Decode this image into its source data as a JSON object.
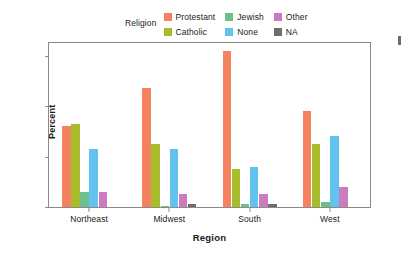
{
  "legend": {
    "title": "Religion",
    "position": "top-center",
    "items": [
      {
        "label": "Protestant",
        "color": "#F4825E",
        "swatch_name": "legend-swatch-protestant"
      },
      {
        "label": "Jewish",
        "color": "#6DC08B",
        "swatch_name": "legend-swatch-jewish"
      },
      {
        "label": "Other",
        "color": "#CB7CC0",
        "swatch_name": "legend-swatch-other"
      },
      {
        "label": "Catholic",
        "color": "#A8BD2E",
        "swatch_name": "legend-swatch-catholic"
      },
      {
        "label": "None",
        "color": "#62C3F0",
        "swatch_name": "legend-swatch-none"
      },
      {
        "label": "NA",
        "color": "#6D6D6D",
        "swatch_name": "legend-swatch-na"
      }
    ]
  },
  "chart_data": {
    "type": "bar",
    "title": "",
    "xlabel": "Region",
    "ylabel": "Percent",
    "categories": [
      "Northeast",
      "Midwest",
      "South",
      "West"
    ],
    "ylim": [
      0,
      65
    ],
    "yticks": [
      0,
      20,
      40,
      60
    ],
    "ytick_labels": [
      "0",
      "20",
      "40",
      "60"
    ],
    "grid": false,
    "legend_position": "top-center",
    "series": [
      {
        "name": "Protestant",
        "color": "#F4825E",
        "values": [
          32,
          47,
          62,
          38
        ]
      },
      {
        "name": "Catholic",
        "color": "#A8BD2E",
        "values": [
          33,
          25,
          15,
          25
        ]
      },
      {
        "name": "Jewish",
        "color": "#6DC08B",
        "values": [
          6,
          0.5,
          1,
          2
        ]
      },
      {
        "name": "None",
        "color": "#62C3F0",
        "values": [
          23,
          23,
          16,
          28
        ]
      },
      {
        "name": "Other",
        "color": "#CB7CC0",
        "values": [
          6,
          5,
          5,
          8
        ]
      },
      {
        "name": "NA",
        "color": "#6D6D6D",
        "values": [
          0,
          1,
          1,
          0
        ]
      }
    ]
  }
}
